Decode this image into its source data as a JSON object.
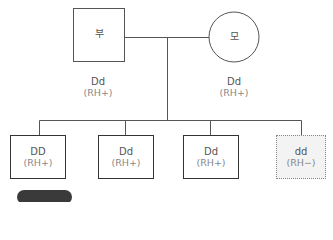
{
  "father": {
    "symbol_text": "부",
    "genotype": "Dd",
    "phenotype": "(RH+)"
  },
  "mother": {
    "symbol_text": "모",
    "genotype": "Dd",
    "phenotype": "(RH+)"
  },
  "children": [
    {
      "genotype": "DD",
      "phenotype": "(RH+)",
      "style": "solid"
    },
    {
      "genotype": "Dd",
      "phenotype": "(RH+)",
      "style": "solid"
    },
    {
      "genotype": "Dd",
      "phenotype": "(RH+)",
      "style": "solid"
    },
    {
      "genotype": "dd",
      "phenotype": "(RH−)",
      "style": "dotted"
    }
  ],
  "caption": {
    "badge": "",
    "text": ""
  },
  "colors": {
    "line": "#555555",
    "box_border": "#333333",
    "dotted_border": "#888888",
    "dotted_fill": "#f3f3f3",
    "badge": "#3a3a3a"
  }
}
